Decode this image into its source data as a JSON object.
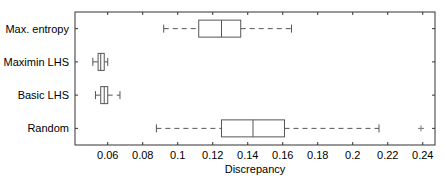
{
  "chart_data": {
    "type": "boxplot",
    "orientation": "horizontal",
    "title": "",
    "xlabel": "Discrepancy",
    "ylabel": "",
    "xlim": [
      0.0413,
      0.247
    ],
    "x_ticks": [
      0.06,
      0.08,
      0.1,
      0.12,
      0.14,
      0.16,
      0.18,
      0.2,
      0.22,
      0.24
    ],
    "x_tick_labels": [
      "0.06",
      "0.08",
      "0.1",
      "0.12",
      "0.14",
      "0.16",
      "0.18",
      "0.2",
      "0.22",
      "0.24"
    ],
    "grid": false,
    "categories": [
      "Max. entropy",
      "Maximin LHS",
      "Basic LHS",
      "Random"
    ],
    "series": [
      {
        "name": "Max. entropy",
        "whisker_low": 0.092,
        "q1": 0.112,
        "median": 0.125,
        "q3": 0.136,
        "whisker_high": 0.165,
        "outliers": []
      },
      {
        "name": "Maximin LHS",
        "whisker_low": 0.0515,
        "q1": 0.0545,
        "median": 0.056,
        "q3": 0.058,
        "whisker_high": 0.06,
        "outliers": []
      },
      {
        "name": "Basic LHS",
        "whisker_low": 0.053,
        "q1": 0.056,
        "median": 0.058,
        "q3": 0.06,
        "whisker_high": 0.067,
        "outliers": []
      },
      {
        "name": "Random",
        "whisker_low": 0.0878,
        "q1": 0.125,
        "median": 0.143,
        "q3": 0.161,
        "whisker_high": 0.215,
        "outliers": [
          0.239
        ]
      }
    ]
  },
  "colors": {
    "axis": "#333333",
    "box": "#555555",
    "whisker": "#555555",
    "outlier": "#777777"
  }
}
